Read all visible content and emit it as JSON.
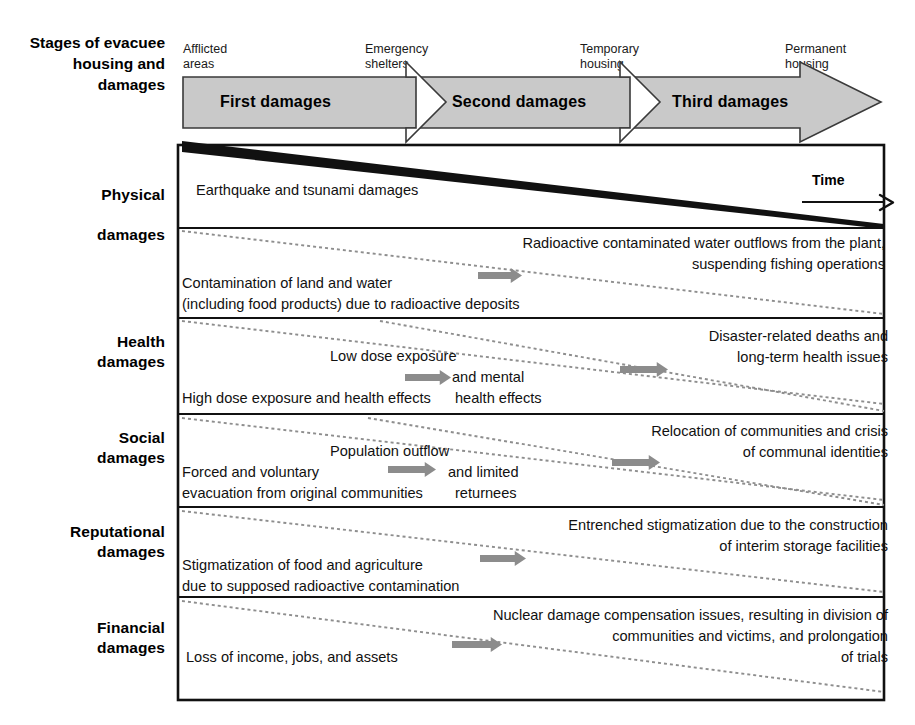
{
  "diagram": {
    "title_row_label": "Stages of\nevacuee\nhousing and\ndamages",
    "time_label": "Time",
    "stage_captions": [
      {
        "text": "Afflicted\nareas",
        "x": 183,
        "y": 42
      },
      {
        "text": "Emergency\nshelters",
        "x": 365,
        "y": 42
      },
      {
        "text": "Temporary\nhousing",
        "x": 580,
        "y": 42
      },
      {
        "text": "Permanent\nhousing",
        "x": 785,
        "y": 42
      }
    ],
    "band_stages": [
      {
        "label": "First damages",
        "x": 220,
        "y": 93
      },
      {
        "label": "Second damages",
        "x": 452,
        "y": 93
      },
      {
        "label": "Third damages",
        "x": 672,
        "y": 93
      }
    ],
    "band_color": "#c9c9c9",
    "band_border": "#3a3a3a",
    "arrow_marker_color": "#8c8c8c",
    "wedge_color": "#000000",
    "rows": [
      {
        "name": "physical",
        "label": "Physical\n\ndamages",
        "label_y": 185,
        "top": 145,
        "bottom": 228,
        "wedge": "solid",
        "texts": [
          {
            "text": "Earthquake and tsunami damages",
            "x": 196,
            "y": 180,
            "align": "l",
            "w": 420
          }
        ],
        "markers": []
      },
      {
        "name": "radiological",
        "label": "",
        "label_y": 0,
        "top": 228,
        "bottom": 318,
        "wedge": "dotted",
        "texts": [
          {
            "text": "Radioactive contaminated water outflows from the plant,\nsuspending fishing operations",
            "x": 425,
            "y": 233,
            "align": "r",
            "w": 460
          },
          {
            "text": "Contamination of land and water\n(including food products) due to radioactive deposits",
            "x": 182,
            "y": 273,
            "align": "l",
            "w": 430
          }
        ],
        "markers": [
          {
            "x": 478,
            "y": 268,
            "w": 44
          }
        ]
      },
      {
        "name": "health",
        "label": "Health\ndamages",
        "label_y": 332,
        "top": 318,
        "bottom": 414,
        "wedge": "dotted-double",
        "texts": [
          {
            "text": "Disaster-related deaths and\nlong-term health issues",
            "x": 570,
            "y": 326,
            "align": "r",
            "w": 318
          },
          {
            "text": "Low dose exposure",
            "x": 330,
            "y": 346,
            "align": "l",
            "w": 200
          },
          {
            "text": "and  mental",
            "x": 452,
            "y": 367,
            "align": "l",
            "w": 140
          },
          {
            "text": "High dose exposure and health effects",
            "x": 182,
            "y": 388,
            "align": "l",
            "w": 330
          },
          {
            "text": "health effects",
            "x": 455,
            "y": 388,
            "align": "l",
            "w": 150
          }
        ],
        "markers": [
          {
            "x": 405,
            "y": 370,
            "w": 46
          },
          {
            "x": 620,
            "y": 362,
            "w": 48
          }
        ]
      },
      {
        "name": "social",
        "label": "Social\ndamages",
        "label_y": 428,
        "top": 414,
        "bottom": 507,
        "wedge": "dotted-double",
        "texts": [
          {
            "text": "Relocation of communities and crisis\nof communal identities",
            "x": 510,
            "y": 421,
            "align": "r",
            "w": 378
          },
          {
            "text": "Population outflow",
            "x": 330,
            "y": 441,
            "align": "l",
            "w": 190
          },
          {
            "text": "and   limited",
            "x": 448,
            "y": 462,
            "align": "l",
            "w": 150
          },
          {
            "text": "Forced and voluntary\nevacuation from original communities",
            "x": 182,
            "y": 462,
            "align": "l",
            "w": 330
          },
          {
            "text": "returnees",
            "x": 455,
            "y": 483,
            "align": "l",
            "w": 130
          }
        ],
        "markers": [
          {
            "x": 388,
            "y": 462,
            "w": 48
          },
          {
            "x": 612,
            "y": 455,
            "w": 48
          }
        ]
      },
      {
        "name": "reputational",
        "label": "Reputational\ndamages",
        "label_y": 522,
        "top": 507,
        "bottom": 597,
        "wedge": "dotted",
        "texts": [
          {
            "text": "Entrenched stigmatization due to the construction\nof interim storage facilities",
            "x": 460,
            "y": 515,
            "align": "r",
            "w": 428
          },
          {
            "text": "Stigmatization of food and agriculture\ndue to supposed radioactive contamination",
            "x": 182,
            "y": 555,
            "align": "l",
            "w": 380
          }
        ],
        "markers": [
          {
            "x": 480,
            "y": 551,
            "w": 46
          }
        ]
      },
      {
        "name": "financial",
        "label": "Financial\ndamages",
        "label_y": 618,
        "top": 597,
        "bottom": 700,
        "wedge": "dotted",
        "texts": [
          {
            "text": "Nuclear damage compensation issues, resulting in division of\ncommunities and victims, and prolongation\nof trials",
            "x": 418,
            "y": 605,
            "align": "r",
            "w": 470
          },
          {
            "text": "Loss of income, jobs, and assets",
            "x": 186,
            "y": 647,
            "align": "l",
            "w": 310
          }
        ],
        "markers": [
          {
            "x": 452,
            "y": 637,
            "w": 50
          }
        ]
      }
    ]
  }
}
